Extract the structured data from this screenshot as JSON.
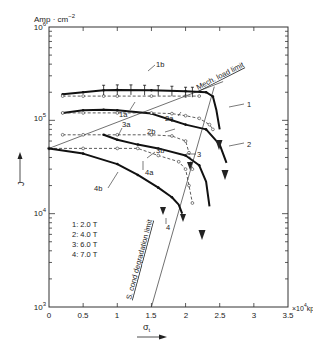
{
  "chart_data": {
    "type": "line",
    "title": "",
    "xlabel": "σt",
    "x_unit": "×10⁴ kp/cm²",
    "ylabel": "J",
    "y_unit": "Amp·cm⁻²",
    "xlim": [
      0,
      3.5
    ],
    "ylim": [
      1000,
      1000000
    ],
    "yscale": "log",
    "grid": false,
    "x_ticks": [
      "0",
      "0.5",
      "1",
      "1.5",
      "2",
      "2.5",
      "3",
      "3.5"
    ],
    "y_ticks": [
      {
        "value": 1000,
        "base": "10",
        "exp": "3"
      },
      {
        "value": 10000,
        "base": "10",
        "exp": "4"
      },
      {
        "value": 100000,
        "base": "10",
        "exp": "5"
      },
      {
        "value": 1000000,
        "base": "10",
        "exp": "6"
      }
    ],
    "legend": [
      {
        "key": "1",
        "label": "1: 2.0 T"
      },
      {
        "key": "2",
        "label": "2: 4.0 T"
      },
      {
        "key": "3",
        "label": "3: 6.0 T"
      },
      {
        "key": "4",
        "label": "4: 7.0 T"
      }
    ],
    "series": [
      {
        "name": "1",
        "style": "solid",
        "x": [
          0.2,
          0.5,
          0.8,
          1.0,
          1.5,
          2.0,
          2.3,
          2.4,
          2.45,
          2.5
        ],
        "y": [
          190000,
          200000,
          210000,
          212000,
          210000,
          205000,
          200000,
          180000,
          130000,
          80000
        ]
      },
      {
        "name": "1a",
        "style": "dashed-open-circles",
        "x": [
          0.2,
          0.5,
          0.8,
          1.0,
          1.5,
          2.0,
          2.2
        ],
        "y": [
          182000,
          182000,
          182000,
          182000,
          182000,
          182000,
          182000
        ]
      },
      {
        "name": "1b",
        "style": "error-bars",
        "x": [
          0.8,
          1.0,
          1.2,
          1.4,
          1.6,
          1.8,
          2.0,
          2.1
        ],
        "y": [
          210000,
          212000,
          212000,
          210000,
          208000,
          205000,
          200000,
          200000
        ]
      },
      {
        "name": "2",
        "style": "solid",
        "x": [
          0.2,
          0.5,
          0.8,
          1.0,
          1.5,
          1.8,
          2.0,
          2.3,
          2.5,
          2.6
        ],
        "y": [
          120000,
          128000,
          130000,
          128000,
          118000,
          100000,
          90000,
          80000,
          55000,
          35000
        ]
      },
      {
        "name": "2a",
        "style": "dashed-open-circles",
        "x": [
          0.2,
          0.5,
          1.0,
          1.5,
          1.8,
          2.0,
          2.2,
          2.35,
          2.4
        ],
        "y": [
          120000,
          120000,
          120000,
          120000,
          118000,
          112000,
          105000,
          90000,
          80000
        ]
      },
      {
        "name": "2b",
        "style": "solid-label",
        "x": [
          1.5,
          1.8,
          2.0
        ],
        "y": [
          118000,
          100000,
          90000
        ]
      },
      {
        "name": "3a",
        "style": "dashed-open-circles",
        "x": [
          0.2,
          0.5,
          1.0,
          1.5,
          1.8,
          2.0,
          2.05,
          2.1
        ],
        "y": [
          70000,
          70000,
          70000,
          70000,
          68000,
          60000,
          45000,
          30000
        ]
      },
      {
        "name": "3b",
        "style": "solid",
        "x": [
          0.8,
          1.0,
          1.3,
          1.6,
          2.0,
          2.2,
          2.3,
          2.35
        ],
        "y": [
          70000,
          62000,
          55000,
          50000,
          42000,
          33000,
          22000,
          12000
        ]
      },
      {
        "name": "4a",
        "style": "dashed-open-circles",
        "x": [
          0.0,
          0.5,
          1.0,
          1.3,
          1.6,
          1.9,
          2.0,
          2.05,
          2.1
        ],
        "y": [
          50000,
          50000,
          50000,
          50000,
          42000,
          36000,
          30000,
          20000,
          13000
        ]
      },
      {
        "name": "4b",
        "style": "solid",
        "x": [
          0.0,
          0.5,
          1.0,
          1.3,
          1.6,
          1.8,
          1.9,
          1.95
        ],
        "y": [
          50000,
          44000,
          34000,
          26000,
          19000,
          15000,
          12500,
          10000
        ]
      },
      {
        "name": "Mech. load limit",
        "style": "thin-line",
        "x": [
          0.0,
          2.55
        ],
        "y": [
          50000,
          260000
        ]
      },
      {
        "name": "S. cond degradation limit",
        "style": "thin-line",
        "x": [
          1.5,
          2.42
        ],
        "y": [
          1000,
          230000
        ]
      }
    ],
    "annotations": [
      "1",
      "1a",
      "1b",
      "2",
      "2a",
      "2b",
      "3",
      "3a",
      "3b",
      "4",
      "4a",
      "4b",
      "Mech. load limit",
      "S. cond degradation limit"
    ]
  },
  "labels": {
    "y_unit_prefix": "Amp · cm",
    "y_unit_exp": "−2",
    "y_axis": "J",
    "x_axis": "σ",
    "x_axis_sub": "t",
    "x_unit_prefix": "×10",
    "x_unit_exp": "4",
    "x_unit_suffix": "kp/cm",
    "x_unit_suffix_exp": "2",
    "mech_limit": "Mech. load limit",
    "scond_limit": "S. cond degradation limit",
    "legend_1": "1: 2.0 T",
    "legend_2": "2: 4.0 T",
    "legend_3": "3: 6.0 T",
    "legend_4": "4: 7.0 T",
    "c1": "1",
    "c1a": "1a",
    "c1b": "1b",
    "c2": "2",
    "c2a": "2a",
    "c2b": "2b",
    "c3": "3",
    "c3a": "3a",
    "c3b": "3b",
    "c4": "4",
    "c4a": "4a",
    "c4b": "4b"
  }
}
